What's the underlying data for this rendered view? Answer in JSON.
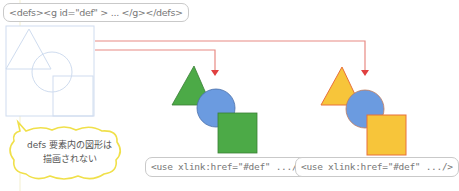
{
  "defs_label": "<defs><g id=\"def\" > ... </g></defs>",
  "use_labels": [
    "<use xlink:href=\"#def\" .../>",
    "<use xlink:href=\"#def\" .../>"
  ],
  "callout": {
    "line1": "defs 要素内の図形は",
    "line2": "描画されない"
  },
  "colors": {
    "connector": "#e88a84",
    "arrow": "#e04040",
    "green_fill": "#4caa47",
    "green_stroke": "#3a7f36",
    "blue_fill": "#6b9be0",
    "blue_stroke": "#4a6fa8",
    "yellow_fill": "#f7c53a",
    "orange_stroke": "#e8703a",
    "ghost_stroke": "#cfdcef",
    "bubble_stroke": "#f0e04a"
  },
  "groups": [
    {
      "name": "defs-ghost",
      "style": "outline"
    },
    {
      "name": "use-instance-1",
      "style": "green"
    },
    {
      "name": "use-instance-2",
      "style": "yellow"
    }
  ]
}
